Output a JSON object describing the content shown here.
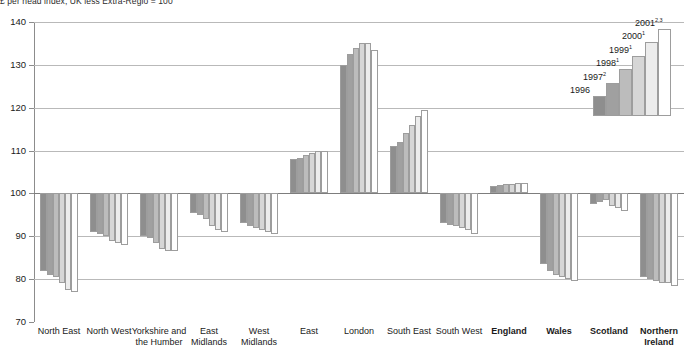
{
  "header": {
    "note": "£ per head index, UK less Extra-Regio = 100"
  },
  "chart_data": {
    "type": "bar",
    "title": "£ per head index, UK less Extra-Regio = 100",
    "xlabel": "",
    "ylabel": "",
    "ylim": [
      70,
      140
    ],
    "yticks": [
      70,
      80,
      90,
      100,
      110,
      120,
      130,
      140
    ],
    "grid": true,
    "baseline": 100,
    "legend_position": "top-right",
    "categories": [
      "North East",
      "North West",
      "Yorkshire and\nthe Humber",
      "East\nMidlands",
      "West\nMidlands",
      "East",
      "London",
      "South East",
      "South West",
      "England",
      "Wales",
      "Scotland",
      "Northern\nIreland"
    ],
    "categories_bold": [
      false,
      false,
      false,
      false,
      false,
      false,
      false,
      false,
      false,
      true,
      true,
      true,
      true
    ],
    "series": [
      {
        "name": "1996",
        "color": "#8e8e8e",
        "values": [
          82.0,
          91.0,
          90.0,
          95.5,
          93.0,
          108.0,
          130.0,
          111.0,
          93.0,
          101.8,
          83.5,
          97.5,
          80.5
        ]
      },
      {
        "name": "1997",
        "color": "#a0a0a0",
        "values": [
          81.0,
          90.5,
          89.5,
          95.0,
          92.5,
          108.2,
          132.5,
          112.0,
          92.7,
          102.0,
          82.0,
          98.0,
          80.0
        ]
      },
      {
        "name": "1998",
        "color": "#bcbcbc",
        "values": [
          80.5,
          90.0,
          88.5,
          94.0,
          92.0,
          109.0,
          134.0,
          114.0,
          92.5,
          102.3,
          81.0,
          98.5,
          79.5
        ]
      },
      {
        "name": "1999",
        "color": "#d6d6d6",
        "values": [
          79.0,
          89.0,
          87.0,
          92.5,
          91.5,
          109.5,
          135.0,
          116.0,
          92.0,
          102.3,
          80.5,
          97.0,
          79.0
        ]
      },
      {
        "name": "2000",
        "color": "#ececec",
        "values": [
          77.5,
          88.5,
          86.5,
          91.5,
          91.0,
          110.0,
          135.0,
          118.0,
          91.5,
          102.5,
          80.0,
          96.5,
          79.0
        ]
      },
      {
        "name": "2001",
        "color": "#ffffff",
        "values": [
          77.0,
          88.0,
          86.5,
          91.0,
          90.5,
          110.0,
          133.5,
          119.5,
          90.5,
          102.5,
          79.5,
          96.0,
          78.5
        ]
      }
    ]
  },
  "legend": {
    "items": [
      {
        "label": "1996",
        "sup": "",
        "color": "#8e8e8e"
      },
      {
        "label": "1997",
        "sup": "2",
        "color": "#a0a0a0"
      },
      {
        "label": "1998",
        "sup": "1",
        "color": "#bcbcbc"
      },
      {
        "label": "1999",
        "sup": "1",
        "color": "#d6d6d6"
      },
      {
        "label": "2000",
        "sup": "1",
        "color": "#ececec"
      },
      {
        "label": "2001",
        "sup": "2,3",
        "color": "#ffffff"
      }
    ]
  },
  "colors": {
    "gridline": "#b9b9b9",
    "baseline": "#7d7d7d",
    "axis": "#8c8c8c",
    "bar_border": "#9d9d9d",
    "text": "#1a1a1a"
  }
}
